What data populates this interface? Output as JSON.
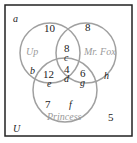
{
  "diagram": {
    "type": "venn-3-set",
    "universe_label": "U",
    "corner_label": "a",
    "sets": [
      {
        "name": "Up"
      },
      {
        "name": "Mr. Fox"
      },
      {
        "name": "Princess"
      }
    ],
    "regions": {
      "up_only": {
        "value": "10",
        "variable": "b"
      },
      "fox_only": {
        "value": "8",
        "variable": "h"
      },
      "up_fox_only": {
        "value": "8",
        "variable": "c"
      },
      "all_three": {
        "value": "4",
        "variable": "d"
      },
      "up_princess_only": {
        "value": "12",
        "variable": "e"
      },
      "fox_princess_only": {
        "value": "6",
        "variable": "g"
      },
      "princess_only": {
        "value": "7",
        "variable": "f"
      },
      "outside": {
        "value": "5"
      }
    },
    "colors": {
      "frame": "#222222",
      "circles": "#a0a0a0",
      "set_label": "#9a9a9a"
    }
  }
}
